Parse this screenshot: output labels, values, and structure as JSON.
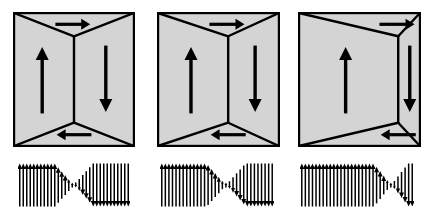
{
  "figure": {
    "background_color": "#ffffff",
    "domain_fill_color": "#d4d4d4",
    "line_color": "#000000",
    "arrow_color": "#000000",
    "width": 429,
    "height": 218
  },
  "panels": [
    {
      "id": "panel-1",
      "label": "panel-1",
      "x": 13,
      "y": 12,
      "width": 120,
      "height": 133,
      "wall_position_fraction": 0.5,
      "domains": [
        {
          "name": "top-closure-domain",
          "magnetization": "right",
          "arrow_direction": "right"
        },
        {
          "name": "left-domain",
          "magnetization": "up",
          "arrow_direction": "up"
        },
        {
          "name": "right-domain",
          "magnetization": "down",
          "arrow_direction": "down"
        },
        {
          "name": "bottom-closure-domain",
          "magnetization": "left",
          "arrow_direction": "left"
        }
      ],
      "spin_chain": {
        "x": 18,
        "y": 160,
        "width": 112,
        "height": 50,
        "count": 32,
        "wall_center_fraction": 0.5,
        "wall_width_fraction": 0.34,
        "start_direction": "up",
        "end_direction": "down"
      }
    },
    {
      "id": "panel-2",
      "label": "panel-2",
      "x": 157,
      "y": 12,
      "width": 121,
      "height": 133,
      "wall_position_fraction": 0.58,
      "domains": [
        {
          "name": "top-closure-domain",
          "magnetization": "right",
          "arrow_direction": "right"
        },
        {
          "name": "left-domain",
          "magnetization": "up",
          "arrow_direction": "up"
        },
        {
          "name": "right-domain",
          "magnetization": "down",
          "arrow_direction": "down"
        },
        {
          "name": "bottom-closure-domain",
          "magnetization": "left",
          "arrow_direction": "left"
        }
      ],
      "spin_chain": {
        "x": 160,
        "y": 160,
        "width": 114,
        "height": 50,
        "count": 32,
        "wall_center_fraction": 0.58,
        "wall_width_fraction": 0.34,
        "start_direction": "up",
        "end_direction": "down"
      }
    },
    {
      "id": "panel-3",
      "label": "panel-3",
      "x": 298,
      "y": 12,
      "width": 121,
      "height": 133,
      "wall_position_fraction": 0.82,
      "domains": [
        {
          "name": "top-closure-domain",
          "magnetization": "right",
          "arrow_direction": "right"
        },
        {
          "name": "left-domain",
          "magnetization": "up",
          "arrow_direction": "up"
        },
        {
          "name": "right-domain",
          "magnetization": "down",
          "arrow_direction": "down"
        },
        {
          "name": "bottom-closure-domain",
          "magnetization": "left",
          "arrow_direction": "left"
        }
      ],
      "spin_chain": {
        "x": 300,
        "y": 160,
        "width": 114,
        "height": 50,
        "count": 32,
        "wall_center_fraction": 0.8,
        "wall_width_fraction": 0.3,
        "start_direction": "up",
        "end_direction": "down"
      }
    }
  ]
}
